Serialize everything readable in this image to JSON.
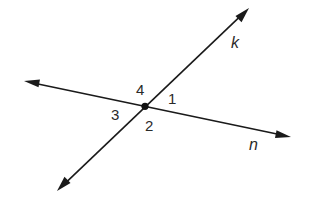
{
  "diagram": {
    "lines": [
      {
        "name": "k",
        "label": "k",
        "arrows": "both"
      },
      {
        "name": "n",
        "label": "n",
        "arrows": "both"
      }
    ],
    "intersection_point": {
      "marked": true
    },
    "angles": [
      {
        "label": "1",
        "between": "ray k (upper-right) and ray n (right)"
      },
      {
        "label": "2",
        "between": "ray n (right) and ray k (lower-left)"
      },
      {
        "label": "3",
        "between": "ray k (lower-left) and ray n (left)"
      },
      {
        "label": "4",
        "between": "ray n (left) and ray k (upper-right)"
      }
    ],
    "colors": {
      "ink": "#1a1a1a",
      "background": "#ffffff"
    }
  }
}
